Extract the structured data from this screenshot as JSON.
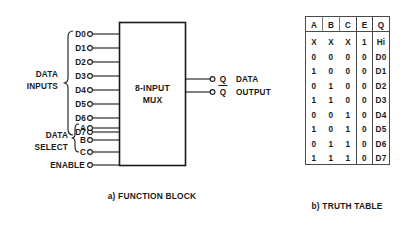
{
  "figure": {
    "function_block": {
      "block_label_line1": "8-INPUT",
      "block_label_line2": "MUX",
      "data_inputs_group_line1": "DATA",
      "data_inputs_group_line2": "INPUTS",
      "data_select_group_line1": "DATA",
      "data_select_group_line2": "SELECT",
      "enable_label": "ENABLE",
      "data_input_pins": [
        "D0",
        "D1",
        "D2",
        "D3",
        "D4",
        "D5",
        "D6",
        "D7"
      ],
      "select_pins": [
        "A",
        "B",
        "C"
      ],
      "outputs": [
        {
          "label": "Q",
          "overbar": false
        },
        {
          "label": "Q",
          "overbar": true
        }
      ],
      "output_group_line1": "DATA",
      "output_group_line2": "OUTPUT",
      "caption": "a) FUNCTION BLOCK"
    },
    "truth_table": {
      "caption": "b) TRUTH TABLE",
      "columns": [
        "A",
        "B",
        "C",
        "E",
        "Q"
      ],
      "rows": [
        [
          "X",
          "X",
          "X",
          "1",
          "Hi"
        ],
        [
          "0",
          "0",
          "0",
          "0",
          "D0"
        ],
        [
          "1",
          "0",
          "0",
          "0",
          "D1"
        ],
        [
          "0",
          "1",
          "0",
          "0",
          "D2"
        ],
        [
          "1",
          "1",
          "0",
          "0",
          "D3"
        ],
        [
          "0",
          "0",
          "1",
          "0",
          "D4"
        ],
        [
          "1",
          "0",
          "1",
          "0",
          "D5"
        ],
        [
          "0",
          "1",
          "1",
          "0",
          "D6"
        ],
        [
          "1",
          "1",
          "1",
          "0",
          "D7"
        ]
      ]
    }
  },
  "colors": {
    "ink": "#1a1a1a",
    "table_rule": "#4a4a4a",
    "background": "#ffffff"
  }
}
